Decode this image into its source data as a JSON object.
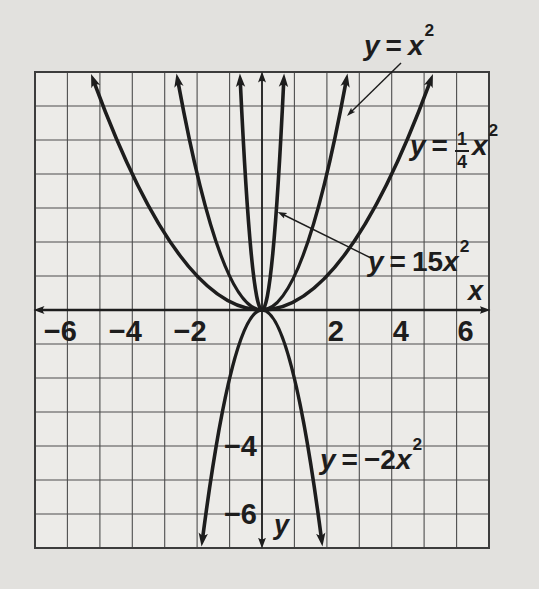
{
  "palette": {
    "page_bg": "#e2e1de",
    "cell_bg": "#edecе9",
    "grid_bg": "#ecebe8",
    "grid_line": "#4d4d4d",
    "border_line": "#3c3c3c",
    "ink": "#1d1d1d"
  },
  "axes": {
    "x_label": "x",
    "y_label": "y",
    "x_ticks": [
      {
        "v": -6,
        "label": "−6"
      },
      {
        "v": -4,
        "label": "−4"
      },
      {
        "v": -2,
        "label": "−2"
      },
      {
        "v": 2,
        "label": "2"
      },
      {
        "v": 4,
        "label": "4"
      },
      {
        "v": 6,
        "label": "6"
      }
    ],
    "y_ticks": [
      {
        "v": -4,
        "label": "−4"
      },
      {
        "v": -6,
        "label": "−6"
      }
    ]
  },
  "equations": {
    "basic": {
      "y": "y",
      "eq": "=",
      "var": "x",
      "sup": "2"
    },
    "quarter": {
      "y": "y",
      "eq": "=",
      "num": "1",
      "den": "4",
      "var": "x",
      "sup": "2"
    },
    "fifteen": {
      "y": "y",
      "eq": "=",
      "coef": "15",
      "var": "x",
      "sup": "2"
    },
    "neg2": {
      "y": "y",
      "eq": "=",
      "coef": "−2",
      "var": "x",
      "sup": "2"
    }
  },
  "chart_data": {
    "type": "line",
    "title": "",
    "xlabel": "x",
    "ylabel": "y",
    "xlim": [
      -7,
      7
    ],
    "ylim": [
      -7,
      7
    ],
    "grid": true,
    "grid_step": 1,
    "x_tick_values": [
      -6,
      -4,
      -2,
      2,
      4,
      6
    ],
    "y_tick_values": [
      -4,
      -6
    ],
    "legend_position": "inline-labels-with-leader-arrows",
    "series": [
      {
        "key": "quarter",
        "name": "y = (1/4)x^2",
        "a": 0.25,
        "points": {
          "x": [
            -5,
            -4,
            -2,
            0,
            2,
            4,
            5
          ],
          "y": [
            6.25,
            4,
            1,
            0,
            1,
            4,
            6.25
          ]
        }
      },
      {
        "key": "basic",
        "name": "y = x^2",
        "a": 1,
        "points": {
          "x": [
            -2.5,
            -2,
            -1,
            0,
            1,
            2,
            2.5
          ],
          "y": [
            6.25,
            4,
            1,
            0,
            1,
            4,
            6.25
          ]
        }
      },
      {
        "key": "fifteen",
        "name": "y = 15x^2",
        "a": 15,
        "points": {
          "x": [
            -0.66,
            -0.5,
            -0.25,
            0,
            0.25,
            0.5,
            0.66
          ],
          "y": [
            6.5,
            3.75,
            0.94,
            0,
            0.94,
            3.75,
            6.5
          ]
        }
      },
      {
        "key": "neg2",
        "name": "y = -2x^2",
        "a": -2,
        "points": {
          "x": [
            -1.8,
            -1,
            -0.5,
            0,
            0.5,
            1,
            1.8
          ],
          "y": [
            -6.5,
            -2,
            -0.5,
            0,
            -0.5,
            -2,
            -6.5
          ]
        }
      }
    ],
    "annotations": [
      {
        "label": "y = x^2",
        "points_to": "right branch of y = x^2 curve"
      },
      {
        "label": "y = 15x^2",
        "points_to": "right branch of y = 15x^2 curve"
      }
    ]
  }
}
